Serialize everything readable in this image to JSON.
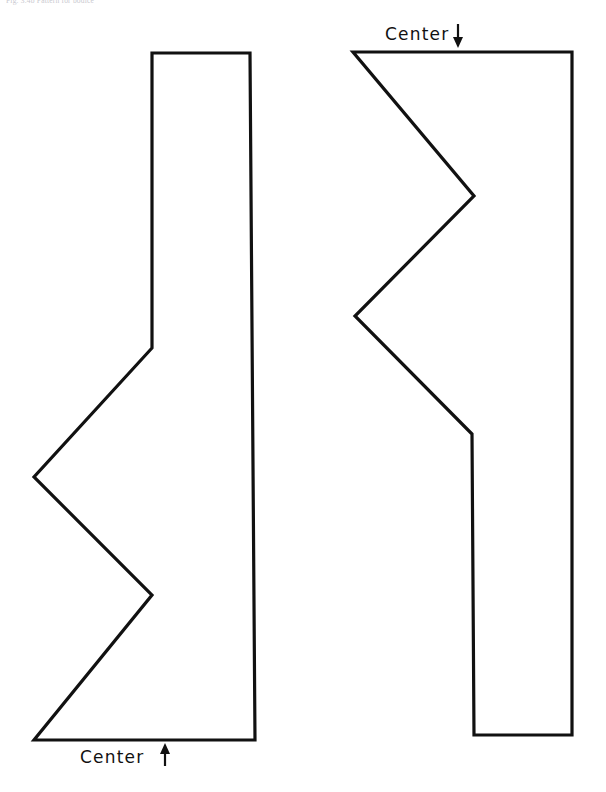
{
  "page": {
    "width": 606,
    "height": 792,
    "background_color": "#ffffff",
    "ink_color": "#111111",
    "header_caption": "Fig. 3.4b  Pattern for bodice"
  },
  "labels": {
    "top": {
      "text": "Center",
      "icon": "arrow-down-icon",
      "direction": "down",
      "x": 385,
      "y": 40
    },
    "bottom": {
      "text": "Center",
      "icon": "arrow-up-icon",
      "direction": "up",
      "x": 80,
      "y": 763
    }
  },
  "chart_data": {
    "type": "line",
    "xlabel": "",
    "ylabel": "",
    "xlim": [
      0,
      606
    ],
    "ylim": [
      792,
      0
    ],
    "grid": false,
    "legend": "none",
    "series": [
      {
        "name": "left-pattern-piece",
        "closed": true,
        "points": [
          [
            152,
            53
          ],
          [
            250,
            53
          ],
          [
            255,
            740
          ],
          [
            34,
            740
          ],
          [
            152,
            595
          ],
          [
            34,
            477
          ],
          [
            152,
            348
          ]
        ]
      },
      {
        "name": "right-pattern-piece",
        "closed": true,
        "points": [
          [
            353,
            52
          ],
          [
            572,
            52
          ],
          [
            572,
            735
          ],
          [
            474,
            735
          ],
          [
            472,
            434
          ],
          [
            355,
            316
          ],
          [
            474,
            196
          ]
        ]
      }
    ],
    "annotations": [
      {
        "text": "Center",
        "arrow": "down",
        "x": 385,
        "y": 40
      },
      {
        "text": "Center",
        "arrow": "up",
        "x": 80,
        "y": 763
      }
    ]
  }
}
